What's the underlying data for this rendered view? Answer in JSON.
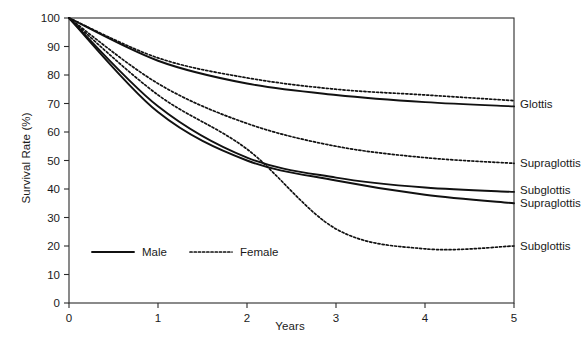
{
  "chart_data": {
    "type": "line",
    "title": "",
    "xlabel": "Years",
    "ylabel": "Survival Rate (%)",
    "xlim": [
      0,
      5
    ],
    "ylim": [
      0,
      100
    ],
    "xticks": [
      "0",
      "1",
      "2",
      "3",
      "4",
      "5"
    ],
    "yticks": [
      "0",
      "10",
      "20",
      "30",
      "40",
      "50",
      "60",
      "70",
      "80",
      "90",
      "100"
    ],
    "grid": false,
    "legend_position": "inside-lower-left",
    "x": [
      0,
      1,
      2,
      3,
      4,
      5
    ],
    "series": [
      {
        "name": "Glottis Female",
        "site": "Glottis",
        "sex": "Female",
        "style": "dotted",
        "end_label": "Glottis",
        "values": [
          100,
          86,
          79,
          75,
          73,
          71
        ]
      },
      {
        "name": "Glottis Male",
        "site": "Glottis",
        "sex": "Male",
        "style": "solid",
        "end_label": "Glottis",
        "values": [
          100,
          85,
          77,
          73,
          70.5,
          69
        ]
      },
      {
        "name": "Supraglottis Female",
        "site": "Supraglottis",
        "sex": "Female",
        "style": "dotted",
        "end_label": "Supraglottis",
        "values": [
          100,
          77,
          63,
          55,
          51,
          49
        ]
      },
      {
        "name": "Subglottis Male",
        "site": "Subglottis",
        "sex": "Male",
        "style": "solid",
        "end_label": "Subglottis",
        "values": [
          100,
          69,
          51,
          44,
          40.5,
          39
        ]
      },
      {
        "name": "Supraglottis Male",
        "site": "Supraglottis",
        "sex": "Male",
        "style": "solid",
        "end_label": "Supraglottis",
        "values": [
          100,
          67,
          50,
          43,
          38,
          35
        ]
      },
      {
        "name": "Subglottis Female",
        "site": "Subglottis",
        "sex": "Female",
        "style": "dotted",
        "end_label": "Subglottis",
        "values": [
          100,
          73,
          54,
          26,
          19,
          20
        ]
      }
    ],
    "end_labels": [
      {
        "text": "Glottis",
        "value": 70
      },
      {
        "text": "Supraglottis",
        "value": 49
      },
      {
        "text": "Subglottis",
        "value": 39.5
      },
      {
        "text": "Supraglottis",
        "value": 35
      },
      {
        "text": "Subglottis",
        "value": 20
      }
    ],
    "legend": [
      {
        "label": "Male",
        "style": "solid"
      },
      {
        "label": "Female",
        "style": "dotted"
      }
    ]
  }
}
